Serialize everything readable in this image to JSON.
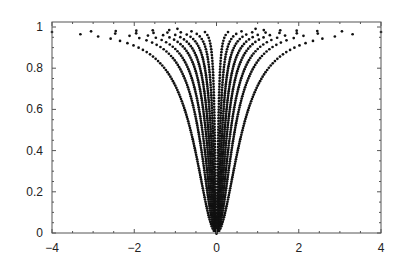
{
  "chart_data": {
    "type": "scatter",
    "title": "",
    "xlabel": "",
    "ylabel": "",
    "xlim": [
      -4,
      4
    ],
    "ylim": [
      0,
      1
    ],
    "grid": false,
    "legend": null,
    "x_ticks": [
      -4,
      -2,
      0,
      2,
      4
    ],
    "x_tick_labels": [
      "-4",
      "-2",
      "0",
      "2",
      "4"
    ],
    "y_ticks": [
      0,
      0.2,
      0.4,
      0.6,
      0.8,
      1
    ],
    "y_tick_labels": [
      "0",
      "0.2",
      "0.4",
      "0.6",
      "0.8",
      "1"
    ],
    "series": [
      {
        "name": "c=0.4",
        "c": 0.4,
        "x": [
          -4,
          -2,
          -1,
          -0.57,
          0,
          0.57,
          1,
          2,
          4
        ],
        "values": [
          0.976,
          0.91,
          0.71,
          0.45,
          0,
          0.45,
          0.71,
          0.91,
          0.976
        ]
      },
      {
        "name": "c=0.2",
        "c": 0.2,
        "x": [
          -3,
          -2,
          -1,
          -0.5,
          0,
          0.5,
          1,
          2,
          3
        ],
        "values": [
          0.978,
          0.952,
          0.833,
          0.556,
          0,
          0.556,
          0.833,
          0.952,
          0.978
        ]
      },
      {
        "name": "c=0.12",
        "c": 0.12,
        "x": [
          -2.5,
          -1.5,
          -1,
          -0.4,
          0,
          0.4,
          1,
          1.5,
          2.5
        ],
        "values": [
          0.981,
          0.949,
          0.893,
          0.571,
          0,
          0.571,
          0.893,
          0.949,
          0.981
        ]
      },
      {
        "name": "c=0.07",
        "c": 0.07,
        "x": [
          -2,
          -1,
          -0.5,
          -0.3,
          0,
          0.3,
          0.5,
          1,
          2
        ],
        "values": [
          0.983,
          0.935,
          0.781,
          0.563,
          0,
          0.563,
          0.781,
          0.935,
          0.983
        ]
      },
      {
        "name": "c=0.04",
        "c": 0.04,
        "x": [
          -1.6,
          -0.8,
          -0.4,
          -0.2,
          0,
          0.2,
          0.4,
          0.8,
          1.6
        ],
        "values": [
          0.985,
          0.941,
          0.8,
          0.5,
          0,
          0.5,
          0.8,
          0.941,
          0.985
        ]
      },
      {
        "name": "c=0.02",
        "c": 0.02,
        "x": [
          -1.2,
          -0.6,
          -0.3,
          -0.14,
          0,
          0.14,
          0.3,
          0.6,
          1.2
        ],
        "values": [
          0.986,
          0.947,
          0.818,
          0.495,
          0,
          0.495,
          0.818,
          0.947,
          0.986
        ]
      },
      {
        "name": "c=0.008",
        "c": 0.008,
        "x": [
          -0.95,
          -0.5,
          -0.2,
          -0.09,
          0,
          0.09,
          0.2,
          0.5,
          0.95
        ],
        "values": [
          0.991,
          0.969,
          0.833,
          0.503,
          0,
          0.503,
          0.833,
          0.969,
          0.991
        ]
      },
      {
        "name": "c=0.002",
        "c": 0.002,
        "x": [
          -0.28,
          -0.15,
          -0.08,
          -0.045,
          0,
          0.045,
          0.08,
          0.15,
          0.28
        ],
        "values": [
          0.975,
          0.918,
          0.762,
          0.503,
          0,
          0.503,
          0.762,
          0.918,
          0.975
        ]
      }
    ],
    "curve_params": [
      {
        "c": 0.4,
        "xmax": 4.0,
        "n": 90
      },
      {
        "c": 0.2,
        "xmax": 3.05,
        "n": 90
      },
      {
        "c": 0.12,
        "xmax": 2.45,
        "n": 90
      },
      {
        "c": 0.07,
        "xmax": 1.95,
        "n": 90
      },
      {
        "c": 0.04,
        "xmax": 1.55,
        "n": 90
      },
      {
        "c": 0.02,
        "xmax": 1.15,
        "n": 90
      },
      {
        "c": 0.008,
        "xmax": 0.95,
        "n": 80
      },
      {
        "c": 0.002,
        "xmax": 0.28,
        "n": 70
      }
    ],
    "colors": {
      "points": "#111111",
      "axes": "#555555",
      "text": "#222222"
    }
  },
  "layout": {
    "plot_left": 52,
    "plot_right": 381,
    "plot_top": 22,
    "plot_bottom": 233,
    "y_at_one": 27
  }
}
